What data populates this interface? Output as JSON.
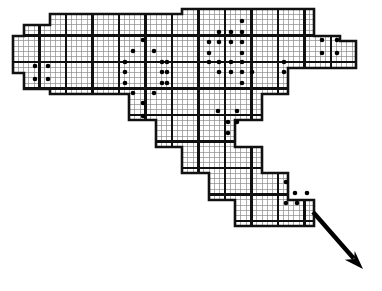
{
  "figure": {
    "width": 382,
    "height": 291,
    "background_color": "#ffffff",
    "ink_color": "#000000",
    "fine_grid_color": "#8c8c8c",
    "bold_grid_color": "#111111",
    "fine_cell_size": 5.3,
    "bold_cell_size": 26.5,
    "fine_line_width": 0.7,
    "bold_line_width": 2.6,
    "marker": {
      "name": "cell-dot",
      "shape": "filled-circle",
      "radius": 2.3,
      "color": "#000000",
      "count": 66
    },
    "arrow": {
      "name": "direction-arrow",
      "from_x": 313,
      "from_y": 212,
      "to_x": 363,
      "to_y": 269,
      "color": "#000000",
      "shaft_width": 4.4,
      "head_length": 19,
      "head_width": 15
    }
  },
  "chart_data": {
    "type": "heatmap",
    "xlabel": "",
    "ylabel": "",
    "grid": true,
    "legend": "none",
    "xlim": [
      0,
      382
    ],
    "ylim": [
      0,
      291
    ],
    "domain_polygon": [
      [
        13,
        47
      ],
      [
        13,
        36
      ],
      [
        24,
        36
      ],
      [
        24,
        25
      ],
      [
        50,
        25
      ],
      [
        50,
        14
      ],
      [
        182,
        14
      ],
      [
        182,
        9
      ],
      [
        314,
        9
      ],
      [
        314,
        36
      ],
      [
        340,
        36
      ],
      [
        340,
        41
      ],
      [
        356,
        41
      ],
      [
        356,
        68
      ],
      [
        288,
        68
      ],
      [
        288,
        94
      ],
      [
        262,
        94
      ],
      [
        262,
        120
      ],
      [
        235,
        120
      ],
      [
        235,
        147
      ],
      [
        262,
        147
      ],
      [
        262,
        173
      ],
      [
        288,
        173
      ],
      [
        288,
        200
      ],
      [
        314,
        200
      ],
      [
        314,
        226
      ],
      [
        235,
        226
      ],
      [
        235,
        200
      ],
      [
        209,
        200
      ],
      [
        209,
        173
      ],
      [
        182,
        173
      ],
      [
        182,
        147
      ],
      [
        156,
        147
      ],
      [
        156,
        120
      ],
      [
        129,
        120
      ],
      [
        129,
        94
      ],
      [
        50,
        94
      ],
      [
        50,
        89
      ],
      [
        24,
        89
      ],
      [
        24,
        73
      ],
      [
        13,
        73
      ]
    ],
    "bold_block_size": 26.5,
    "fine_subdivisions_per_block": 5,
    "marked_cells": [
      {
        "x": 35,
        "y": 66,
        "label": "dot"
      },
      {
        "x": 48,
        "y": 66,
        "label": "dot"
      },
      {
        "x": 35,
        "y": 79,
        "label": "dot"
      },
      {
        "x": 48,
        "y": 79,
        "label": "dot"
      },
      {
        "x": 143,
        "y": 40,
        "label": "dot"
      },
      {
        "x": 133,
        "y": 51,
        "label": "dot"
      },
      {
        "x": 154,
        "y": 51,
        "label": "dot"
      },
      {
        "x": 125,
        "y": 62,
        "label": "dot"
      },
      {
        "x": 125,
        "y": 72,
        "label": "dot"
      },
      {
        "x": 125,
        "y": 83,
        "label": "dot"
      },
      {
        "x": 162,
        "y": 62,
        "label": "dot"
      },
      {
        "x": 167,
        "y": 62,
        "label": "dot"
      },
      {
        "x": 162,
        "y": 72,
        "label": "dot"
      },
      {
        "x": 167,
        "y": 72,
        "label": "dot"
      },
      {
        "x": 162,
        "y": 83,
        "label": "dot"
      },
      {
        "x": 167,
        "y": 83,
        "label": "dot"
      },
      {
        "x": 133,
        "y": 93,
        "label": "dot"
      },
      {
        "x": 154,
        "y": 93,
        "label": "dot"
      },
      {
        "x": 143,
        "y": 103,
        "label": "dot"
      },
      {
        "x": 143,
        "y": 116,
        "label": "dot"
      },
      {
        "x": 242,
        "y": 21,
        "label": "dot"
      },
      {
        "x": 219,
        "y": 32,
        "label": "dot"
      },
      {
        "x": 231,
        "y": 32,
        "label": "dot"
      },
      {
        "x": 242,
        "y": 32,
        "label": "dot"
      },
      {
        "x": 209,
        "y": 42,
        "label": "dot"
      },
      {
        "x": 219,
        "y": 42,
        "label": "dot"
      },
      {
        "x": 231,
        "y": 42,
        "label": "dot"
      },
      {
        "x": 242,
        "y": 42,
        "label": "dot"
      },
      {
        "x": 209,
        "y": 53,
        "label": "dot"
      },
      {
        "x": 242,
        "y": 53,
        "label": "dot"
      },
      {
        "x": 209,
        "y": 62,
        "label": "dot"
      },
      {
        "x": 219,
        "y": 62,
        "label": "dot"
      },
      {
        "x": 231,
        "y": 62,
        "label": "dot"
      },
      {
        "x": 242,
        "y": 62,
        "label": "dot"
      },
      {
        "x": 219,
        "y": 72,
        "label": "dot"
      },
      {
        "x": 231,
        "y": 72,
        "label": "dot"
      },
      {
        "x": 242,
        "y": 72,
        "label": "dot"
      },
      {
        "x": 252,
        "y": 72,
        "label": "dot"
      },
      {
        "x": 242,
        "y": 83,
        "label": "dot"
      },
      {
        "x": 284,
        "y": 62,
        "label": "dot"
      },
      {
        "x": 284,
        "y": 72,
        "label": "dot"
      },
      {
        "x": 322,
        "y": 40,
        "label": "dot"
      },
      {
        "x": 337,
        "y": 40,
        "label": "dot"
      },
      {
        "x": 322,
        "y": 53,
        "label": "dot"
      },
      {
        "x": 337,
        "y": 53,
        "label": "dot"
      },
      {
        "x": 218,
        "y": 111,
        "label": "dot"
      },
      {
        "x": 237,
        "y": 111,
        "label": "dot"
      },
      {
        "x": 228,
        "y": 122,
        "label": "dot"
      },
      {
        "x": 237,
        "y": 122,
        "label": "dot"
      },
      {
        "x": 228,
        "y": 133,
        "label": "dot"
      },
      {
        "x": 286,
        "y": 182,
        "label": "dot"
      },
      {
        "x": 295,
        "y": 193,
        "label": "dot"
      },
      {
        "x": 307,
        "y": 193,
        "label": "dot"
      },
      {
        "x": 286,
        "y": 203,
        "label": "dot"
      },
      {
        "x": 297,
        "y": 203,
        "label": "dot"
      }
    ]
  }
}
